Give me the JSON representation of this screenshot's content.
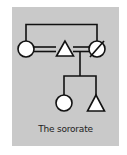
{
  "diagram": {
    "caption": "The sororate",
    "colors": {
      "panel": "#c9c9c9",
      "stroke": "#111111",
      "fill": "#ffffff"
    },
    "nodes": [
      {
        "id": "sister",
        "shape": "circle",
        "sex": "female",
        "deceased": false,
        "generation": 1
      },
      {
        "id": "husband",
        "shape": "triangle",
        "sex": "male",
        "deceased": false,
        "generation": 1
      },
      {
        "id": "wife",
        "shape": "circle",
        "sex": "female",
        "deceased": true,
        "generation": 1
      },
      {
        "id": "daughter",
        "shape": "circle",
        "sex": "female",
        "deceased": false,
        "generation": 2
      },
      {
        "id": "son",
        "shape": "triangle",
        "sex": "male",
        "deceased": false,
        "generation": 2
      }
    ],
    "edges": [
      {
        "type": "sibling",
        "from": "sister",
        "to": "wife"
      },
      {
        "type": "marriage",
        "from": "sister",
        "to": "husband"
      },
      {
        "type": "marriage",
        "from": "husband",
        "to": "wife"
      },
      {
        "type": "descent",
        "from": "husband-wife-marriage",
        "to": [
          "daughter",
          "son"
        ]
      }
    ]
  }
}
